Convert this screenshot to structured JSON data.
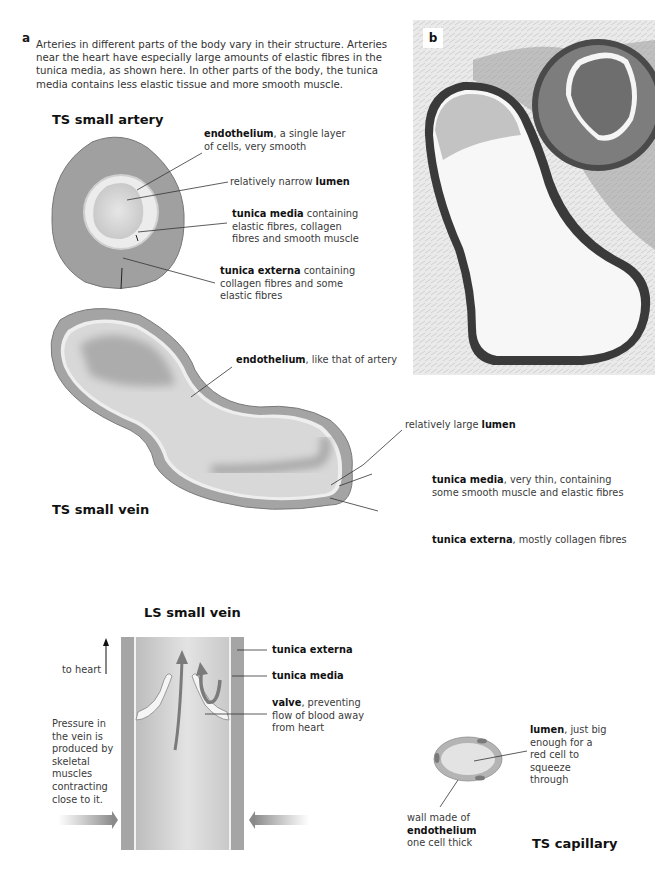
{
  "panel_a": {
    "letter": "a",
    "intro": "Arteries in different parts of the body vary in their structure. Arteries near the heart have especially large amounts of elastic fibres in the tunica media, as shown here. In other parts of the body, the tunica media contains less elastic tissue and more smooth muscle."
  },
  "panel_b": {
    "letter": "b",
    "image": "micrograph-artery-and-vein-cross-section"
  },
  "artery": {
    "title": "TS small artery",
    "labels": [
      {
        "bold": "endothelium",
        "text": ", a single layer of cells, very smooth"
      },
      {
        "pre": "relatively narrow ",
        "bold": "lumen"
      },
      {
        "bold": "tunica media",
        "text": " containing elastic fibres, collagen fibres and smooth muscle"
      },
      {
        "bold": "tunica externa",
        "text": " containing collagen fibres and some elastic fibres"
      }
    ]
  },
  "vein": {
    "title": "TS small vein",
    "labels": [
      {
        "bold": "endothelium",
        "text": ", like that of artery"
      },
      {
        "pre": "relatively large ",
        "bold": "lumen"
      },
      {
        "bold": "tunica media",
        "text": ", very thin, containing some smooth muscle and elastic fibres"
      },
      {
        "bold": "tunica externa",
        "text": ", mostly collagen fibres"
      }
    ]
  },
  "ls_vein": {
    "title": "LS small vein",
    "to_heart": "to heart",
    "pressure_note": "Pressure in the vein is produced by skeletal muscles contracting close to it.",
    "labels": [
      {
        "bold": "tunica externa"
      },
      {
        "bold": "tunica media"
      },
      {
        "bold": "valve",
        "text": ", preventing flow of blood away from heart"
      }
    ]
  },
  "capillary": {
    "title": "TS capillary",
    "labels": [
      {
        "bold": "lumen",
        "text": ", just big enough for a red cell to squeeze through"
      },
      {
        "pre": "wall made of ",
        "bold": "endothelium",
        "post": " one cell thick"
      }
    ]
  },
  "colors": {
    "wall_dark": "#8c8c8c",
    "wall_mid": "#a6a6a6",
    "lumen": "#d9d9d9",
    "endothelium": "#f2f2f2",
    "leader_line": "#333333"
  }
}
